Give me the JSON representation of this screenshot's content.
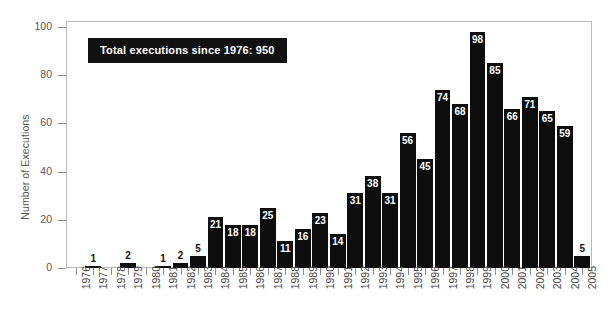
{
  "chart_data": {
    "type": "bar",
    "title": "",
    "subtitle": "",
    "xlabel": "",
    "ylabel": "Number of Executions",
    "ylim": [
      0,
      102
    ],
    "yticks": [
      0,
      20,
      40,
      60,
      80,
      100
    ],
    "grid": false,
    "legend": null,
    "bar_color": "#0d0d0d",
    "annotations": [
      {
        "name": "total-executions-callout",
        "text": "Total executions since 1976: 950",
        "style": "black box, white bold text"
      }
    ],
    "categories": [
      "1976",
      "1977",
      "1978",
      "1979",
      "1980",
      "1981",
      "1982",
      "1983",
      "1984",
      "1985",
      "1986",
      "1987",
      "1988",
      "1989",
      "1990",
      "1991",
      "1992",
      "1993",
      "1994",
      "1995",
      "1996",
      "1997",
      "1998",
      "1999",
      "2000",
      "2001",
      "2002",
      "2003",
      "2004",
      "2005"
    ],
    "values": [
      0,
      1,
      0,
      2,
      0,
      1,
      2,
      5,
      21,
      18,
      18,
      25,
      11,
      16,
      23,
      14,
      31,
      38,
      31,
      56,
      45,
      74,
      68,
      98,
      85,
      66,
      71,
      65,
      59,
      5
    ],
    "point_labels": [
      "",
      "1",
      "",
      "2",
      "",
      "1",
      "2",
      "5",
      "21",
      "18",
      "18",
      "25",
      "11",
      "16",
      "23",
      "14",
      "31",
      "38",
      "31",
      "56",
      "45",
      "74",
      "68",
      "98",
      "85",
      "66",
      "71",
      "65",
      "59",
      "5"
    ]
  },
  "axis": {
    "y_title": "Number of Executions",
    "y_tick_labels": [
      "0",
      "20",
      "40",
      "60",
      "80",
      "100"
    ]
  }
}
